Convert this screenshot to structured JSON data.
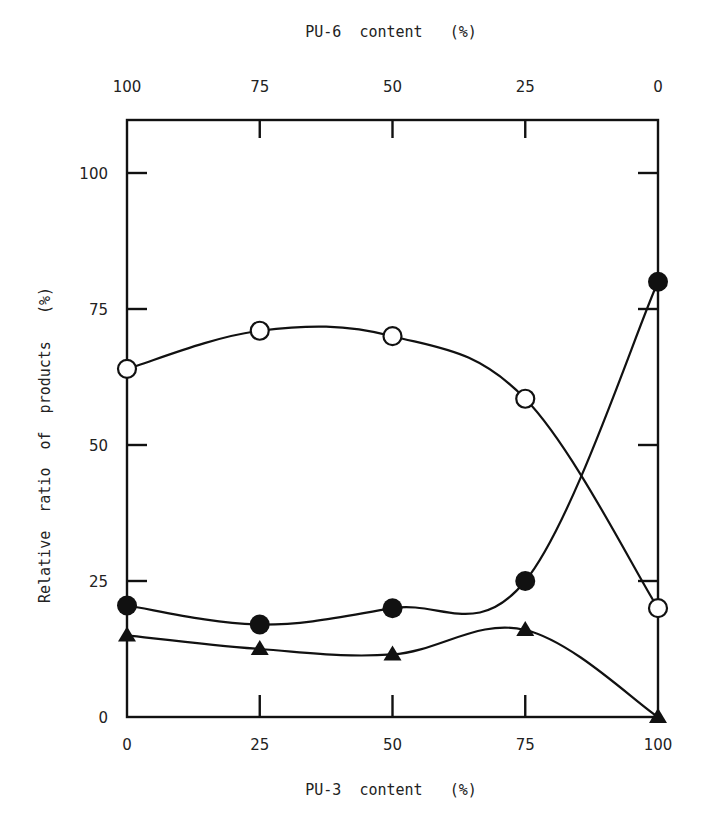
{
  "chart_data": {
    "type": "line",
    "title": "",
    "xlabel": "PU-3  content   (%)",
    "x2label": "PU-6  content   (%)",
    "ylabel": "Relative  ratio  of  products   (%)",
    "x": [
      0,
      25,
      50,
      75,
      100
    ],
    "x_tick_labels": [
      "0",
      "25",
      "50",
      "75",
      "100"
    ],
    "x2_tick_labels": [
      "100",
      "75",
      "50",
      "25",
      "0"
    ],
    "y_tick_labels": [
      "0",
      "25",
      "50",
      "75",
      "100"
    ],
    "xlim": [
      0,
      100
    ],
    "ylim": [
      0,
      110
    ],
    "grid": false,
    "legend": "none",
    "series": [
      {
        "name": "open-circle",
        "marker": "open-circle",
        "values": [
          64,
          71,
          70,
          58.5,
          20
        ]
      },
      {
        "name": "filled-circle",
        "marker": "filled-circle",
        "values": [
          20.5,
          17,
          20,
          25,
          80
        ]
      },
      {
        "name": "filled-triangle",
        "marker": "filled-triangle",
        "values": [
          15,
          12.5,
          11.5,
          16,
          0
        ]
      }
    ]
  }
}
